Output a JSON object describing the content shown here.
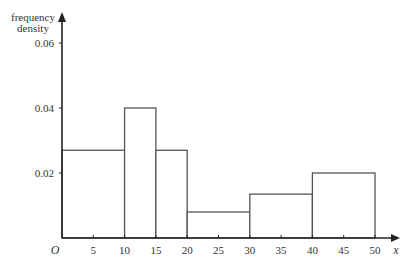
{
  "chart_data": {
    "type": "bar",
    "subtype": "histogram",
    "title": "",
    "xlabel": "x",
    "ylabel": "frequency density",
    "ylabel_lines": [
      "frequency",
      "density"
    ],
    "origin_label": "O",
    "xlim": [
      0,
      50
    ],
    "ylim": [
      0,
      0.06
    ],
    "x_ticks": [
      5,
      10,
      15,
      20,
      25,
      30,
      35,
      40,
      45,
      50
    ],
    "x_tick_labels": [
      "5",
      "10",
      "15",
      "20",
      "25",
      "30",
      "35",
      "40",
      "45",
      "50"
    ],
    "y_ticks": [
      0.02,
      0.04,
      0.06
    ],
    "y_tick_labels": [
      "0.02",
      "0.04",
      "0.06"
    ],
    "grid": false,
    "legend": null,
    "bins": [
      {
        "from": 0,
        "to": 10,
        "density": 0.027
      },
      {
        "from": 10,
        "to": 15,
        "density": 0.04
      },
      {
        "from": 15,
        "to": 20,
        "density": 0.027
      },
      {
        "from": 20,
        "to": 30,
        "density": 0.008
      },
      {
        "from": 30,
        "to": 40,
        "density": 0.0135
      },
      {
        "from": 40,
        "to": 50,
        "density": 0.02
      }
    ],
    "categories": [
      "0-10",
      "10-15",
      "15-20",
      "20-30",
      "30-40",
      "40-50"
    ],
    "values": [
      0.027,
      0.04,
      0.027,
      0.008,
      0.0135,
      0.02
    ],
    "colors": {
      "bar_stroke": "#555555",
      "bar_fill": "#ffffff",
      "axis": "#222222",
      "text": "#333333"
    }
  }
}
